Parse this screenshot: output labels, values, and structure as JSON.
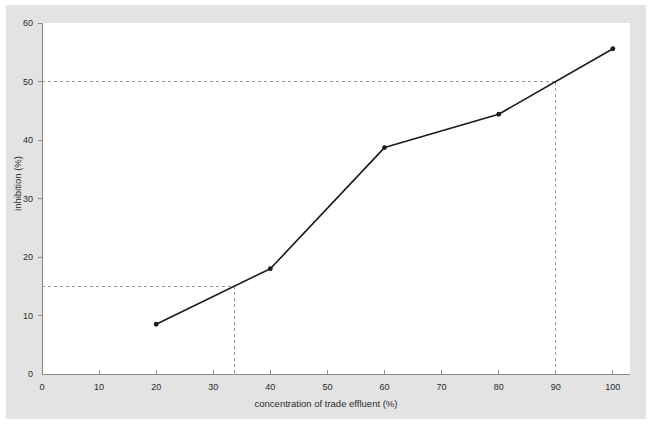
{
  "chart_data": {
    "type": "line",
    "title": "",
    "xlabel": "concentration of trade effluent (%)",
    "ylabel": "inhibition (%)",
    "xlim": [
      0,
      103
    ],
    "ylim": [
      0,
      60
    ],
    "xticks": [
      0,
      10,
      20,
      30,
      40,
      50,
      60,
      70,
      80,
      90,
      100
    ],
    "yticks": [
      0,
      10,
      20,
      30,
      40,
      50,
      60
    ],
    "grid": false,
    "legend": null,
    "series": [
      {
        "name": "inhibition",
        "x": [
          20,
          40,
          60,
          80,
          100
        ],
        "values": [
          8.5,
          18.0,
          38.7,
          44.4,
          55.6
        ],
        "marker": "filled-circle",
        "color": "#1a1a1a",
        "line_width": 1.6
      }
    ],
    "reference_lines": [
      {
        "name": "ec15-guide",
        "style": "dashed",
        "color": "#9a9a9a",
        "horizontal_y": 15.0,
        "vertical_x": 33.8,
        "note": "15% inhibition intercept"
      },
      {
        "name": "ec50-guide",
        "style": "dashed",
        "color": "#9a9a9a",
        "horizontal_y": 50.0,
        "vertical_x": 90.0,
        "note": "50% inhibition intercept"
      }
    ]
  },
  "axes": {
    "x_tick_labels": [
      "0",
      "10",
      "20",
      "30",
      "40",
      "50",
      "60",
      "70",
      "80",
      "90",
      "100"
    ],
    "y_tick_labels": [
      "0",
      "10",
      "20",
      "30",
      "40",
      "50",
      "60"
    ],
    "x_title": "concentration of trade effluent (%)",
    "y_title": "inhibition (%)"
  },
  "colors": {
    "figure_background": "#e3e3e3",
    "plot_background": "#ffffff",
    "page_background": "#ffffff",
    "series_line": "#1a1a1a",
    "axis_line": "#8c8c8c",
    "dashed_guide": "#9a9a9a",
    "text": "#2b2b2b"
  }
}
